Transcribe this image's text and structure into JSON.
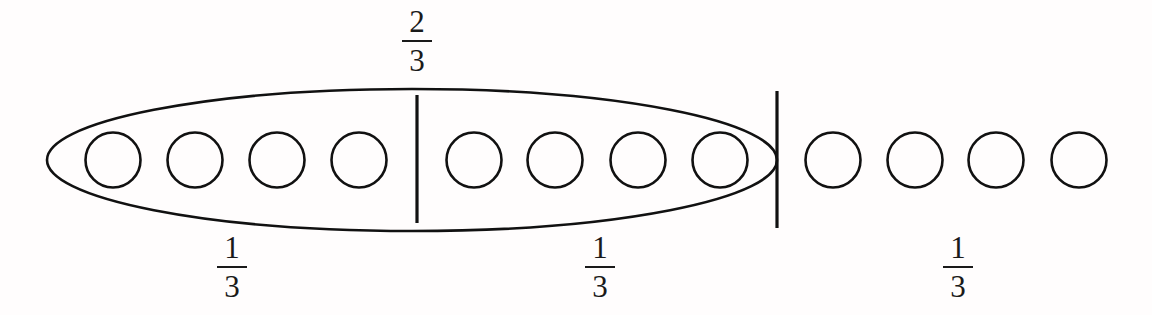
{
  "figure": {
    "background_color": "#fffdfd",
    "ink_color": "#111111",
    "width": 1152,
    "height": 315
  },
  "circles": {
    "count": 12,
    "radius": 27.5,
    "center_y": 160,
    "centers_x": [
      113,
      195,
      277,
      359,
      474,
      555,
      638,
      720,
      833,
      915,
      996,
      1079
    ],
    "inside_group_count": 8,
    "outside_group_count": 4
  },
  "group_ellipse": {
    "center_x": 412,
    "center_y": 160,
    "rx": 365,
    "ry": 71,
    "encloses_circle_indices": [
      0,
      1,
      2,
      3,
      4,
      5,
      6,
      7
    ]
  },
  "dividers": [
    {
      "name": "middle-divider",
      "x": 417,
      "y_top": 95,
      "y_bottom": 223
    },
    {
      "name": "right-divider",
      "x": 777,
      "y_top": 91,
      "y_bottom": 228
    }
  ],
  "labels": {
    "top": [
      {
        "name": "fraction-two-thirds",
        "numerator": "2",
        "denominator": "3",
        "x": 417
      }
    ],
    "bottom": [
      {
        "name": "fraction-one-third-left",
        "numerator": "1",
        "denominator": "3",
        "x": 232
      },
      {
        "name": "fraction-one-third-middle",
        "numerator": "1",
        "denominator": "3",
        "x": 600
      },
      {
        "name": "fraction-one-third-right",
        "numerator": "1",
        "denominator": "3",
        "x": 958
      }
    ]
  },
  "chart_data": {
    "type": "diagram",
    "total_units": 3,
    "unit_label": "1/3",
    "items_per_unit": 4,
    "total_items": 12,
    "highlighted_items": 8,
    "highlighted_fraction": "2/3",
    "segments": [
      {
        "label": "1/3",
        "items": 4,
        "inside_group": true
      },
      {
        "label": "1/3",
        "items": 4,
        "inside_group": true
      },
      {
        "label": "1/3",
        "items": 4,
        "inside_group": false
      }
    ],
    "annotations": [
      "2/3",
      "1/3",
      "1/3",
      "1/3"
    ]
  }
}
